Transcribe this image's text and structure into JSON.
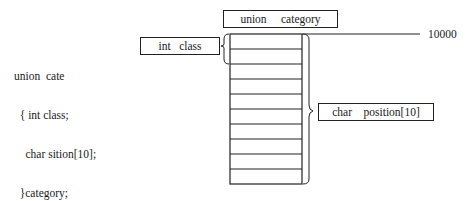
{
  "code": {
    "lines": [
      "union  cate",
      "  { int class;",
      "    char sition[10];",
      "  }category;"
    ]
  },
  "diagram": {
    "union_label": "union     category",
    "int_label": "int   class",
    "char_label": "char    position[10]",
    "address": "10000",
    "cell_count": 10
  }
}
